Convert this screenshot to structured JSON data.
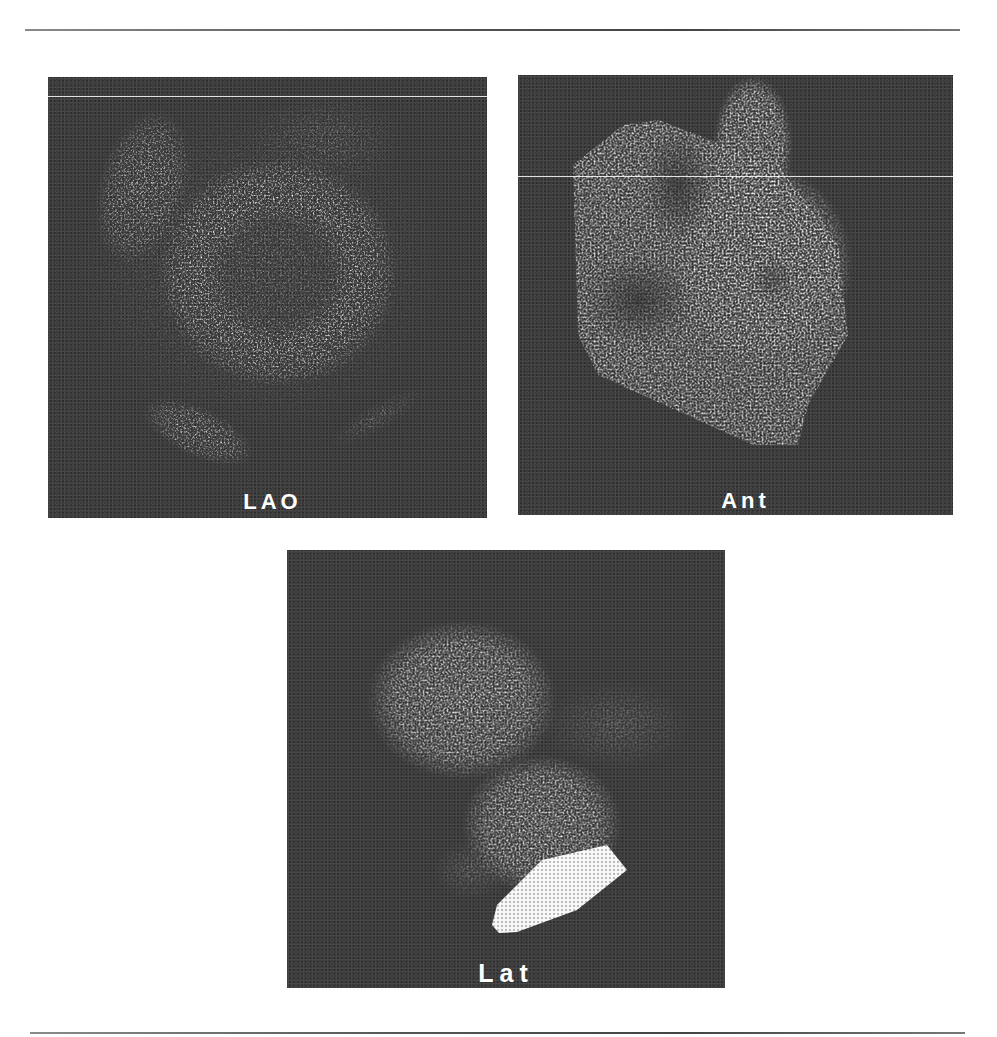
{
  "figure": {
    "panels": [
      {
        "id": "lao",
        "label": "LAO",
        "description": "Left anterior oblique scintigraphic view with ring-shaped uptake"
      },
      {
        "id": "ant",
        "label": "Ant",
        "description": "Anterior scintigraphic view"
      },
      {
        "id": "lat",
        "label": "Lat",
        "description": "Lateral scintigraphic view"
      }
    ]
  },
  "colors": {
    "panel_background": "#3a3a3a",
    "uptake": "#ffffff",
    "page": "#ffffff",
    "rule": "#555555"
  }
}
